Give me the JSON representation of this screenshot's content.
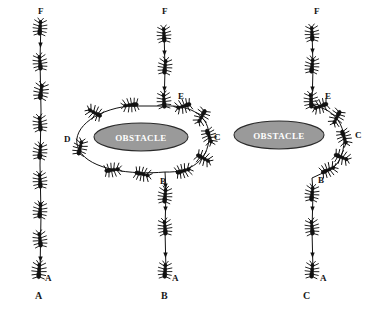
{
  "figure": {
    "background_color": "#ffffff",
    "ink_color": "#111111",
    "obstacle_fill": "#9a9a9a",
    "obstacle_stroke": "#2a2a2a",
    "obstacle_label_color": "#ffffff"
  },
  "panels": [
    {
      "id": "A",
      "caption": "A",
      "caption_pos": {
        "x": 38,
        "y": 296
      },
      "obstacle": null,
      "node_labels": [
        {
          "text": "F",
          "x": 38,
          "y": 14
        },
        {
          "text": "A",
          "x": 40,
          "y": 281
        }
      ],
      "ant_count": 9
    },
    {
      "id": "B",
      "caption": "B",
      "caption_pos": {
        "x": 163,
        "y": 296
      },
      "obstacle": {
        "label": "OBSTACLE",
        "cx": 141,
        "cy": 137,
        "rx": 47,
        "ry": 14
      },
      "node_labels": [
        {
          "text": "F",
          "x": 162,
          "y": 14
        },
        {
          "text": "E",
          "x": 178,
          "y": 99
        },
        {
          "text": "C",
          "x": 214,
          "y": 140
        },
        {
          "text": "D",
          "x": 64,
          "y": 142
        },
        {
          "text": "B",
          "x": 160,
          "y": 184
        },
        {
          "text": "A",
          "x": 167,
          "y": 281
        }
      ],
      "ant_count": 16
    },
    {
      "id": "C",
      "caption": "C",
      "caption_pos": {
        "x": 305,
        "y": 296
      },
      "obstacle": {
        "label": "OBSTACLE",
        "cx": 279,
        "cy": 135,
        "rx": 45,
        "ry": 14
      },
      "node_labels": [
        {
          "text": "F",
          "x": 314,
          "y": 14
        },
        {
          "text": "E",
          "x": 325,
          "y": 99
        },
        {
          "text": "C",
          "x": 355,
          "y": 138
        },
        {
          "text": "B",
          "x": 315,
          "y": 183
        },
        {
          "text": "A",
          "x": 317,
          "y": 281
        }
      ],
      "ant_count": 13
    }
  ]
}
